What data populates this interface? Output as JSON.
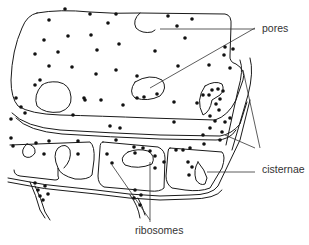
{
  "diagram": {
    "type": "biological-illustration",
    "labels": [
      {
        "id": "pores",
        "text": "pores"
      },
      {
        "id": "cisternae",
        "text": "cisternae"
      },
      {
        "id": "ribosomes",
        "text": "ribosomes"
      }
    ],
    "colors": {
      "background": "#ffffff",
      "line": "#1a1a1a",
      "label": "#333333"
    }
  }
}
